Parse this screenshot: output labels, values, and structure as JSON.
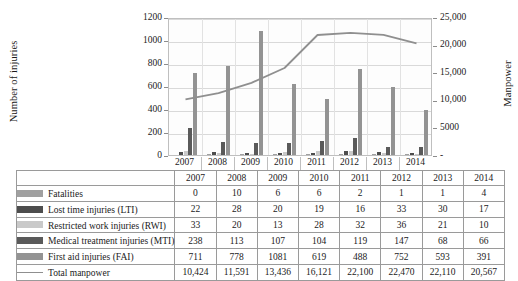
{
  "chart_data": {
    "type": "bar",
    "title": "",
    "xlabel": "",
    "ylabel": "Number of injuries",
    "y2label": "Manpower",
    "categories": [
      "2007",
      "2008",
      "2009",
      "2010",
      "2011",
      "2012",
      "2013",
      "2014"
    ],
    "ylim": [
      0,
      1200
    ],
    "yticks": [
      0,
      200,
      400,
      600,
      800,
      1000,
      1200
    ],
    "ytick_labels": [
      "0",
      "200",
      "400",
      "600",
      "800",
      "1000",
      "1200"
    ],
    "y2lim": [
      0,
      25000
    ],
    "y2ticks": [
      0,
      5000,
      10000,
      15000,
      20000,
      25000
    ],
    "y2tick_labels": [
      "-",
      "5000",
      "10,000",
      "15,000",
      "20,000",
      "25,000"
    ],
    "grid": true,
    "legend_position": "table-below",
    "series": [
      {
        "name": "Fatalities",
        "axis": "left",
        "kind": "bar",
        "color": "#a0a0a0",
        "values": [
          0,
          10,
          6,
          6,
          2,
          1,
          1,
          4
        ]
      },
      {
        "name": "Lost time injuries (LTI)",
        "axis": "left",
        "kind": "bar",
        "color": "#4d4d4d",
        "values": [
          22,
          28,
          20,
          19,
          16,
          33,
          30,
          17
        ]
      },
      {
        "name": "Restricted work injuries (RWI)",
        "axis": "left",
        "kind": "bar",
        "color": "#c9c9c9",
        "values": [
          33,
          20,
          13,
          28,
          32,
          36,
          21,
          10
        ]
      },
      {
        "name": "Medical treatment injuries (MTI)",
        "axis": "left",
        "kind": "bar",
        "color": "#5a5a5a",
        "values": [
          238,
          113,
          107,
          104,
          119,
          147,
          68,
          66
        ]
      },
      {
        "name": "First aid injuries (FAI)",
        "axis": "left",
        "kind": "bar",
        "color": "#939393",
        "values": [
          711,
          778,
          1081,
          619,
          488,
          752,
          593,
          391
        ]
      },
      {
        "name": "Total manpower",
        "axis": "right",
        "kind": "line",
        "color": "#8f8f8f",
        "values": [
          10424,
          11591,
          13436,
          16121,
          22100,
          22470,
          22110,
          20567
        ]
      }
    ]
  },
  "table": {
    "year_headers": [
      "2007",
      "2008",
      "2009",
      "2010",
      "2011",
      "2012",
      "2013",
      "2014"
    ],
    "rows": [
      {
        "label": "Fatalities",
        "marker": "swatch",
        "color": "#a0a0a0",
        "values": [
          "0",
          "10",
          "6",
          "6",
          "2",
          "1",
          "1",
          "4"
        ]
      },
      {
        "label": "Lost time injuries (LTI)",
        "marker": "swatch",
        "color": "#4d4d4d",
        "values": [
          "22",
          "28",
          "20",
          "19",
          "16",
          "33",
          "30",
          "17"
        ]
      },
      {
        "label": "Restricted work injuries (RWI)",
        "marker": "swatch",
        "color": "#c9c9c9",
        "values": [
          "33",
          "20",
          "13",
          "28",
          "32",
          "36",
          "21",
          "10"
        ]
      },
      {
        "label": "Medical treatment injuries (MTI)",
        "marker": "swatch",
        "color": "#5a5a5a",
        "values": [
          "238",
          "113",
          "107",
          "104",
          "119",
          "147",
          "68",
          "66"
        ]
      },
      {
        "label": "First aid injuries (FAI)",
        "marker": "swatch",
        "color": "#939393",
        "values": [
          "711",
          "778",
          "1081",
          "619",
          "488",
          "752",
          "593",
          "391"
        ]
      },
      {
        "label": "Total manpower",
        "marker": "line",
        "color": "#8f8f8f",
        "values": [
          "10,424",
          "11,591",
          "13,436",
          "16,121",
          "22,100",
          "22,470",
          "22,110",
          "20,567"
        ]
      }
    ]
  }
}
